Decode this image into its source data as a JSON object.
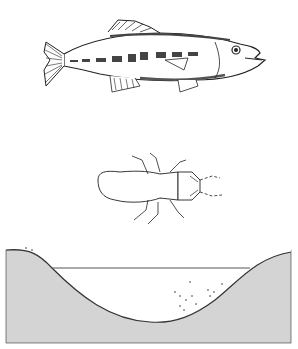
{
  "illustration": {
    "panels": [
      {
        "name": "fish",
        "description": "largemouth bass line drawing"
      },
      {
        "name": "insect-nymph",
        "description": "aquatic insect nymph line drawing"
      },
      {
        "name": "pond-cross-section",
        "description": "pond basin cross-section with water line and vegetation"
      }
    ],
    "colors": {
      "ink": "#222222",
      "soil": "#d4d4d4",
      "water_line": "#555555",
      "background": "#ffffff"
    }
  }
}
